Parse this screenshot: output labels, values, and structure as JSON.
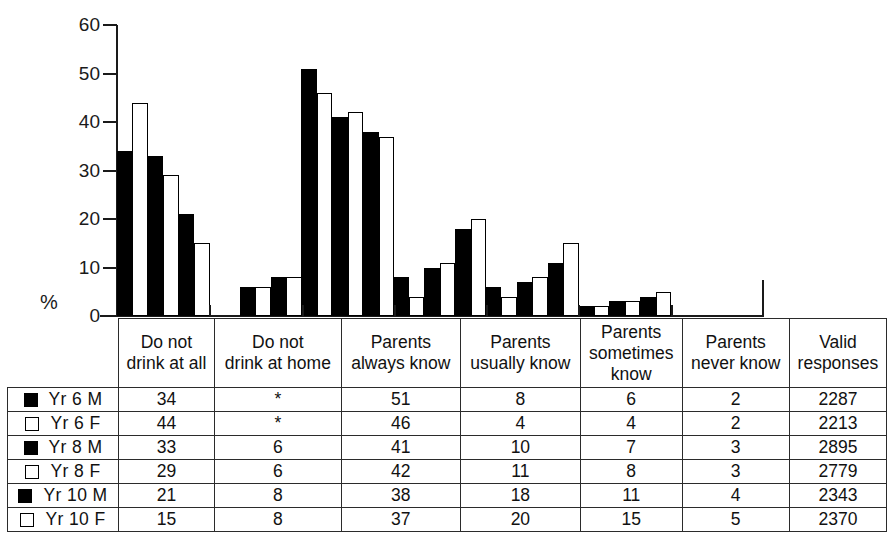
{
  "chart_data": {
    "type": "bar",
    "title": "",
    "subtitle": "",
    "xlabel": "",
    "ylabel": "%",
    "ylim": [
      0,
      60
    ],
    "yticks": [
      0,
      10,
      20,
      30,
      40,
      50,
      60
    ],
    "ytick_labels": [
      "0",
      "10",
      "20",
      "30",
      "40",
      "50",
      "60"
    ],
    "grid": false,
    "legend_position": "table-below",
    "missing_marker": "*",
    "categories": [
      "Do not drink at all",
      "Do not drink at home",
      "Parents always know",
      "Parents usually know",
      "Parents sometimes know",
      "Parents never know"
    ],
    "series": [
      {
        "name": "Yr 6 M",
        "fill": "filled",
        "values": [
          34,
          null,
          51,
          8,
          6,
          2
        ],
        "valid_responses": 2287
      },
      {
        "name": "Yr 6 F",
        "fill": "hollow",
        "values": [
          44,
          null,
          46,
          4,
          4,
          2
        ],
        "valid_responses": 2213
      },
      {
        "name": "Yr 8 M",
        "fill": "filled",
        "values": [
          33,
          6,
          41,
          10,
          7,
          3
        ],
        "valid_responses": 2895
      },
      {
        "name": "Yr 8 F",
        "fill": "hollow",
        "values": [
          29,
          6,
          42,
          11,
          8,
          3
        ],
        "valid_responses": 2779
      },
      {
        "name": "Yr 10 M",
        "fill": "filled",
        "values": [
          21,
          8,
          38,
          18,
          11,
          4
        ],
        "valid_responses": 2343
      },
      {
        "name": "Yr 10 F",
        "fill": "hollow",
        "values": [
          15,
          8,
          37,
          20,
          15,
          5
        ],
        "valid_responses": 2370
      }
    ]
  },
  "axis": {
    "y_label": "%",
    "tick_labels": [
      "60",
      "50",
      "40",
      "30",
      "20",
      "10",
      "0"
    ]
  },
  "table": {
    "column_headers": [
      "",
      "Do not\ndrink at all",
      "Do not\ndrink at home",
      "Parents\nalways know",
      "Parents\nusually know",
      "Parents\nsometimes\nknow",
      "Parents\nnever know",
      "Valid\nresponses"
    ],
    "header_lines": {
      "corner": [
        "",
        "",
        ""
      ],
      "col1": [
        "Do not",
        "drink at all",
        ""
      ],
      "col2": [
        "Do not",
        "drink at home",
        ""
      ],
      "col3": [
        "Parents",
        "always know",
        ""
      ],
      "col4": [
        "Parents",
        "usually know",
        ""
      ],
      "col5": [
        "Parents",
        "sometimes",
        "know"
      ],
      "col6": [
        "Parents",
        "never know",
        ""
      ],
      "col7": [
        "Valid",
        "responses",
        ""
      ]
    },
    "rows": [
      {
        "label": "Yr 6 M",
        "marker": "filled",
        "cells": [
          "34",
          "*",
          "51",
          "8",
          "6",
          "2",
          "2287"
        ]
      },
      {
        "label": "Yr 6 F",
        "marker": "hollow",
        "cells": [
          "44",
          "*",
          "46",
          "4",
          "4",
          "2",
          "2213"
        ]
      },
      {
        "label": "Yr 8 M",
        "marker": "filled",
        "cells": [
          "33",
          "6",
          "41",
          "10",
          "7",
          "3",
          "2895"
        ]
      },
      {
        "label": "Yr 8 F",
        "marker": "hollow",
        "cells": [
          "29",
          "6",
          "42",
          "11",
          "8",
          "3",
          "2779"
        ]
      },
      {
        "label": "Yr 10 M",
        "marker": "filled",
        "cells": [
          "21",
          "8",
          "38",
          "18",
          "11",
          "4",
          "2343"
        ]
      },
      {
        "label": "Yr 10 F",
        "marker": "hollow",
        "cells": [
          "15",
          "8",
          "37",
          "20",
          "15",
          "5",
          "2370"
        ]
      }
    ]
  },
  "colors": {
    "male_fill": "#000000",
    "female_fill": "#ffffff",
    "outline": "#000000",
    "background": "#ffffff"
  }
}
